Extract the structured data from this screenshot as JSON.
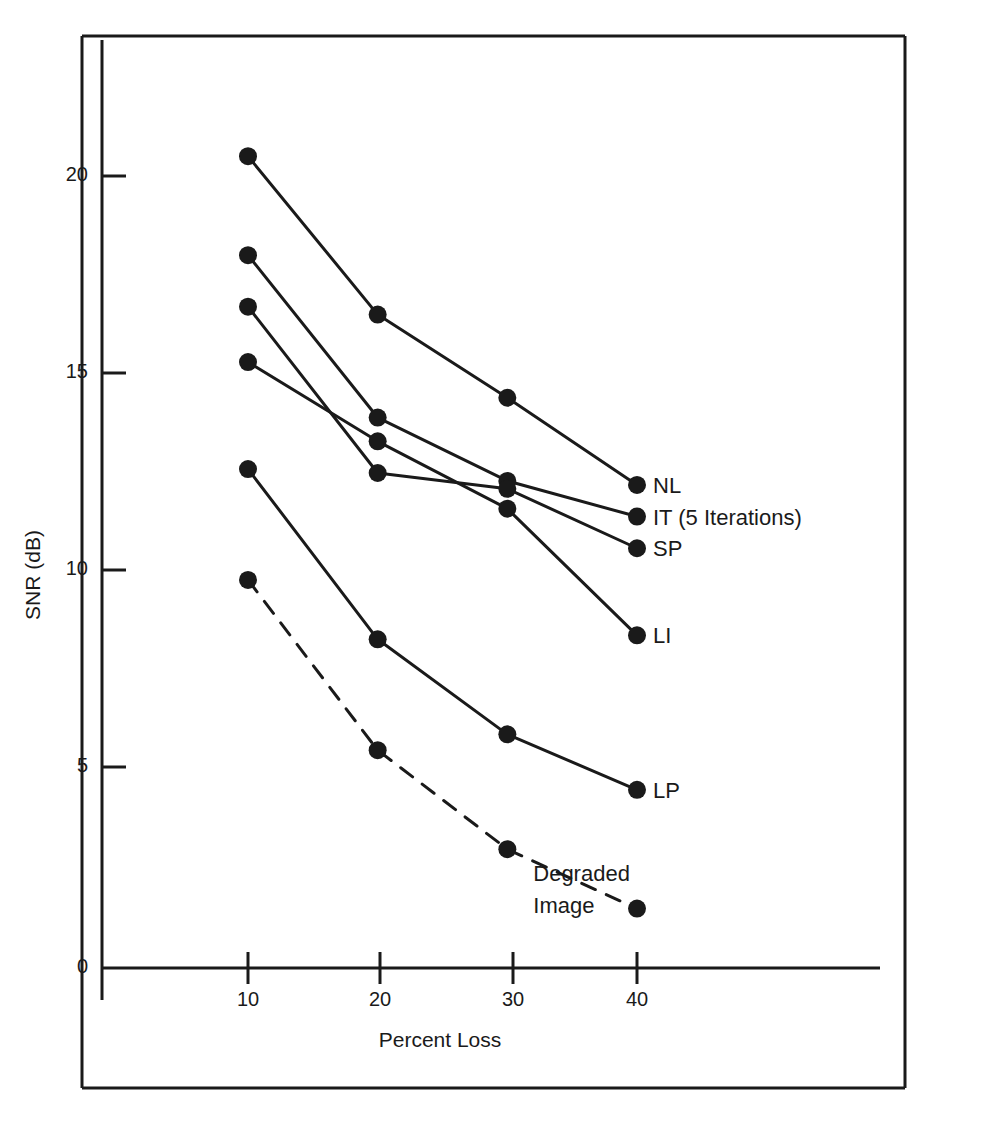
{
  "chart_data": {
    "type": "line",
    "title": "",
    "xlabel": "Percent Loss",
    "ylabel": "SNR (dB)",
    "x": [
      10,
      20,
      30,
      40
    ],
    "xticks": [
      10,
      20,
      30,
      40
    ],
    "xticklabels": [
      "10",
      "20",
      "30",
      "40"
    ],
    "yticks": [
      0,
      5,
      10,
      15,
      20
    ],
    "yticklabels": [
      "0",
      "5",
      "10",
      "15",
      "20"
    ],
    "xlim": [
      5,
      45
    ],
    "ylim": [
      0,
      22.5
    ],
    "grid": false,
    "legend_position": "right-of-line-ends",
    "marker": "filled-circle",
    "series": [
      {
        "name": "NL",
        "label": "NL",
        "style": "solid",
        "color": "#1a1a1a",
        "values": [
          20.5,
          16.5,
          14.4,
          12.2
        ]
      },
      {
        "name": "IT",
        "label": "IT (5 Iterations)",
        "style": "solid",
        "color": "#1a1a1a",
        "values": [
          18.0,
          13.9,
          12.3,
          11.4
        ]
      },
      {
        "name": "SP",
        "label": "SP",
        "style": "solid",
        "color": "#1a1a1a",
        "values": [
          16.7,
          12.5,
          12.1,
          10.6
        ]
      },
      {
        "name": "LI",
        "label": "LI",
        "style": "solid",
        "color": "#1a1a1a",
        "values": [
          15.3,
          13.3,
          11.6,
          8.4
        ]
      },
      {
        "name": "LP",
        "label": "LP",
        "style": "solid",
        "color": "#1a1a1a",
        "values": [
          12.6,
          8.3,
          5.9,
          4.5
        ]
      },
      {
        "name": "Degraded Image",
        "label": "Degraded Image",
        "style": "dashed",
        "color": "#1a1a1a",
        "values": [
          9.8,
          5.5,
          3.0,
          1.5
        ]
      }
    ],
    "annotations": [
      {
        "text": "Degraded",
        "x": 32.0,
        "y": 2.2
      },
      {
        "text": "Image",
        "x": 32.0,
        "y": 1.4
      }
    ]
  },
  "axes": {
    "y_axis_title": "SNR (dB)",
    "x_axis_title": "Percent Loss"
  },
  "frame": {
    "border_color": "#1a1a1a",
    "background": "#ffffff"
  }
}
